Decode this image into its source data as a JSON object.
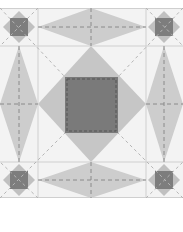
{
  "diagram": {
    "colors": {
      "background": "#f3f3f3",
      "cell_border": "#cfcfcf",
      "kite_fill": "#cdcdcd",
      "center_diamond": "#c6c6c6",
      "center_square": "#7a7a7a",
      "corner_diamond": "#c0c0c0",
      "corner_square": "#7d7d7d",
      "dashed_line": "#8a8a8a",
      "diagonal_dash": "#b5b5b5"
    },
    "grid": {
      "col_lines": [
        38,
        146
      ],
      "row_lines": [
        38,
        154
      ],
      "width": 183,
      "height": 190
    },
    "center_square": {
      "x": 65,
      "y": 69,
      "w": 53,
      "h": 56
    }
  }
}
